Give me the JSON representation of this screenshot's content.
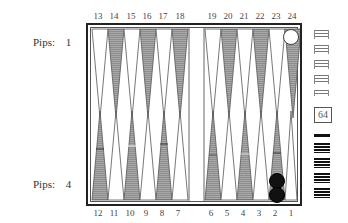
{
  "players": {
    "top": {
      "pips_label": "Pips:",
      "pips_value": "1",
      "checker_color": "white"
    },
    "bottom": {
      "pips_label": "Pips:",
      "pips_value": "4",
      "checker_color": "black"
    }
  },
  "board": {
    "top_numbers": [
      "13",
      "14",
      "15",
      "16",
      "17",
      "18",
      "19",
      "20",
      "21",
      "22",
      "23",
      "24"
    ],
    "bottom_numbers": [
      "12",
      "11",
      "10",
      "9",
      "8",
      "7",
      "6",
      "5",
      "4",
      "3",
      "2",
      "1"
    ],
    "colors": {
      "frame": "#222222",
      "dark_point": "#9a9a9a",
      "light_point": "#ffffff",
      "point_outline": "#555555",
      "black_checker": "#111111",
      "white_checker": "#ffffff"
    },
    "checkers": [
      {
        "point": "24",
        "color": "white",
        "count": 1
      },
      {
        "point": "2",
        "color": "black",
        "count": 2
      }
    ]
  },
  "doubling_cube": {
    "value": "64"
  },
  "trays": {
    "white_borne_off_stacks": 5,
    "black_borne_off_stacks": 5
  }
}
